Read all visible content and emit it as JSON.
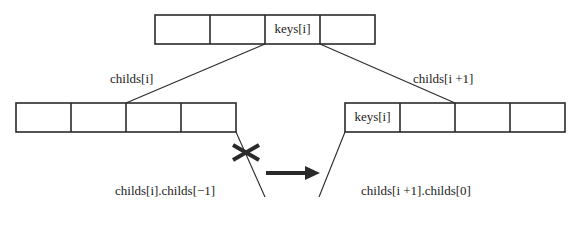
{
  "parent_node": {
    "cells": [
      "",
      "",
      "keys[i]",
      ""
    ]
  },
  "left_child": {
    "label": "childs[i]",
    "cells": [
      "",
      "",
      "",
      ""
    ],
    "moved_child_label": "childs[i].childs[−1]"
  },
  "right_child": {
    "label": "childs[i +1]",
    "cells": [
      "keys[i]",
      "",
      "",
      ""
    ],
    "new_child_label": "childs[i +1].childs[0]"
  },
  "colors": {
    "stroke": "#2a2a2a",
    "background": "#ffffff"
  }
}
